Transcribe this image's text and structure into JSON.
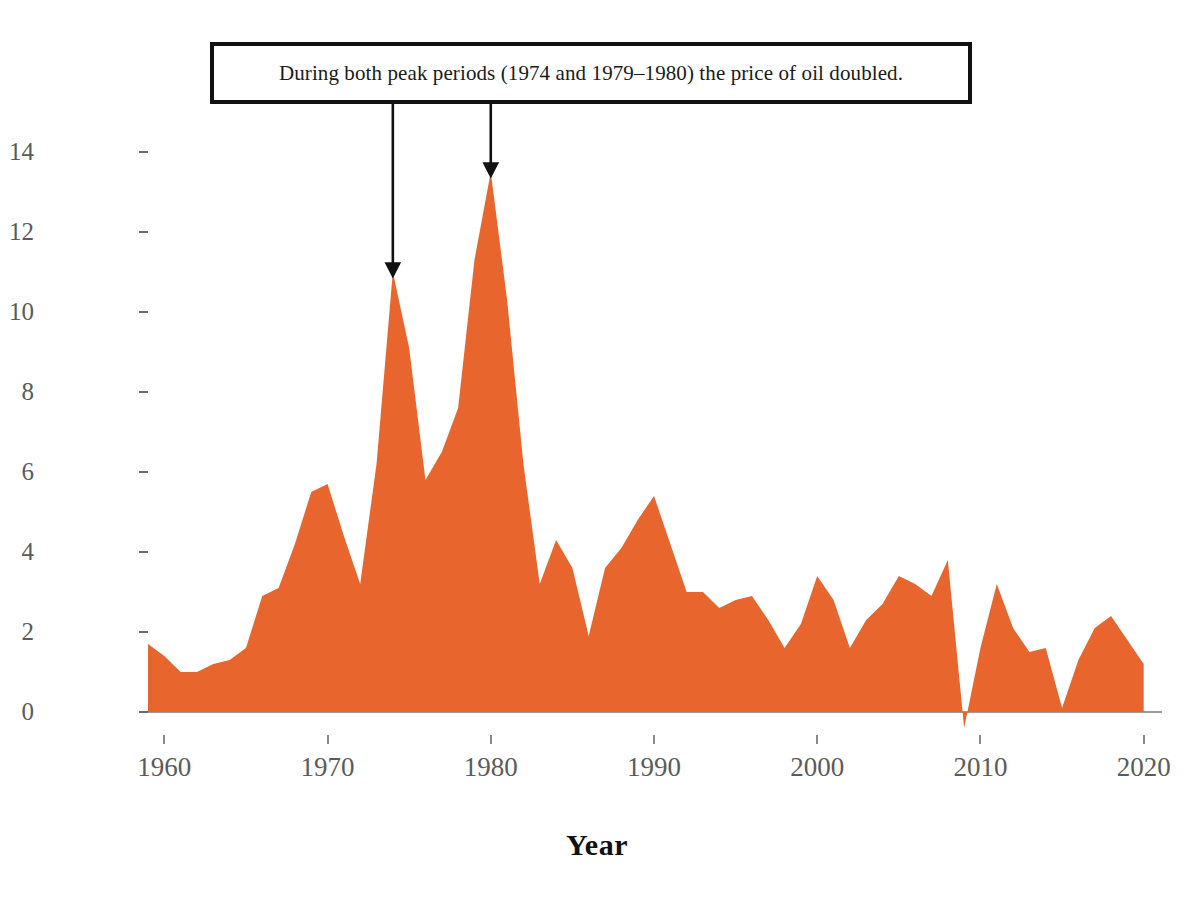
{
  "chart_data": {
    "type": "area",
    "title": "",
    "xlabel": "Year",
    "ylabel": "Inflation Rate (%)",
    "xlim": [
      1959,
      2021
    ],
    "ylim": [
      -1,
      15
    ],
    "grid": false,
    "legend": "none",
    "series_color": "#E8662E",
    "x_ticks": [
      1960,
      1970,
      1980,
      1990,
      2000,
      2010,
      2020
    ],
    "x_tick_labels": [
      "1960",
      "1970",
      "1980",
      "1990",
      "2000",
      "2010",
      "2020"
    ],
    "y_ticks": [
      0,
      2,
      4,
      6,
      8,
      10,
      12,
      14
    ],
    "y_tick_labels": [
      "0",
      "2",
      "4",
      "6",
      "8",
      "10",
      "12",
      "14"
    ],
    "x": [
      1959,
      1960,
      1961,
      1962,
      1963,
      1964,
      1965,
      1966,
      1967,
      1968,
      1969,
      1970,
      1971,
      1972,
      1973,
      1974,
      1975,
      1976,
      1977,
      1978,
      1979,
      1980,
      1981,
      1982,
      1983,
      1984,
      1985,
      1986,
      1987,
      1988,
      1989,
      1990,
      1991,
      1992,
      1993,
      1994,
      1995,
      1996,
      1997,
      1998,
      1999,
      2000,
      2001,
      2002,
      2003,
      2004,
      2005,
      2006,
      2007,
      2008,
      2009,
      2010,
      2011,
      2012,
      2013,
      2014,
      2015,
      2016,
      2017,
      2018,
      2019,
      2020
    ],
    "values": [
      1.7,
      1.4,
      1.0,
      1.0,
      1.2,
      1.3,
      1.6,
      2.9,
      3.1,
      4.2,
      5.5,
      5.7,
      4.4,
      3.2,
      6.2,
      11.0,
      9.1,
      5.8,
      6.5,
      7.6,
      11.3,
      13.5,
      10.3,
      6.2,
      3.2,
      4.3,
      3.6,
      1.9,
      3.6,
      4.1,
      4.8,
      5.4,
      4.2,
      3.0,
      3.0,
      2.6,
      2.8,
      2.9,
      2.3,
      1.6,
      2.2,
      3.4,
      2.8,
      1.6,
      2.3,
      2.7,
      3.4,
      3.2,
      2.9,
      3.8,
      -0.4,
      1.6,
      3.2,
      2.1,
      1.5,
      1.6,
      0.1,
      1.3,
      2.1,
      2.4,
      1.8,
      1.2
    ],
    "annotations": [
      {
        "text": "During both peak periods (1974 and 1979–1980) the price of oil doubled.",
        "arrow_targets": [
          {
            "year": 1974,
            "value": 11.0
          },
          {
            "year": 1980,
            "value": 13.5
          }
        ]
      }
    ]
  },
  "axes": {
    "y_title": "Inflation Rate (%)",
    "x_title": "Year"
  },
  "annotation": {
    "text": "During both peak periods (1974 and 1979–1980) the price of oil doubled."
  },
  "colors": {
    "series": "#E8662E",
    "annotation_border": "#111111",
    "tick_label": "#5b5b5b",
    "axis_title": "#111111",
    "background": "#ffffff"
  }
}
